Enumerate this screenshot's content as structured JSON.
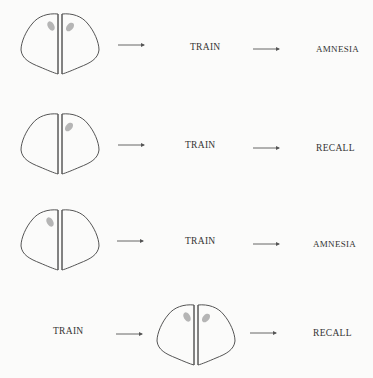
{
  "diagram": {
    "type": "flow-experiment",
    "colors": {
      "outline": "#555555",
      "lesion_shading": "#a8a8a8",
      "text": "#333333",
      "background": "#fbfbfa"
    },
    "rows": [
      {
        "steps": [
          "brain",
          "TRAIN",
          "AMNESIA"
        ],
        "brain": {
          "shading": "both-hemispheres"
        },
        "labels": {
          "middle": "TRAIN",
          "right": "AMNESIA"
        }
      },
      {
        "steps": [
          "brain",
          "TRAIN",
          "RECALL"
        ],
        "brain": {
          "shading": "right-hemisphere"
        },
        "labels": {
          "middle": "TRAIN",
          "right": "RECALL"
        }
      },
      {
        "steps": [
          "brain",
          "TRAIN",
          "AMNESIA"
        ],
        "brain": {
          "shading": "left-hemisphere"
        },
        "labels": {
          "middle": "TRAIN",
          "right": "AMNESIA"
        }
      },
      {
        "steps": [
          "TRAIN",
          "brain",
          "RECALL"
        ],
        "brain": {
          "shading": "both-hemispheres"
        },
        "labels": {
          "left": "TRAIN",
          "right": "RECALL"
        }
      }
    ],
    "arrow_glyph": "right-arrow"
  }
}
